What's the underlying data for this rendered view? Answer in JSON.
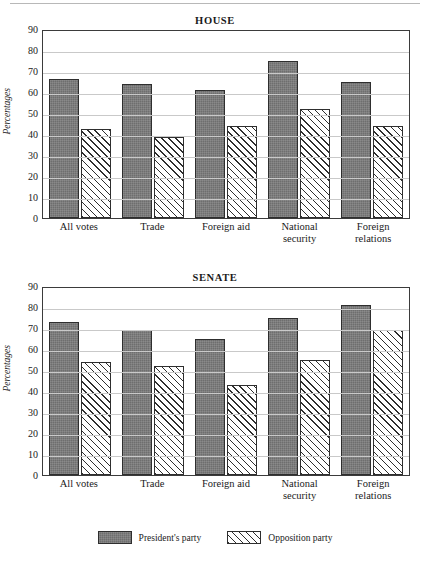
{
  "page": {
    "has_top_rule": true
  },
  "legend": {
    "position": "bottom-center",
    "entries": [
      {
        "label": "President's party",
        "pattern": "solid-dark-gray",
        "color": "#6e6e6e"
      },
      {
        "label": "Opposition party",
        "pattern": "diagonal-hatch",
        "color": "#ffffff"
      }
    ]
  },
  "chart_data": [
    {
      "type": "bar",
      "title": "HOUSE",
      "xlabel": "",
      "ylabel": "Percentages",
      "ylim": [
        0,
        90
      ],
      "yticks": [
        90,
        80,
        70,
        60,
        50,
        40,
        30,
        20,
        10,
        0
      ],
      "grid": true,
      "categories": [
        "All votes",
        "Trade",
        "Foreign aid",
        "National security",
        "Foreign relations"
      ],
      "series": [
        {
          "name": "President's party",
          "values": [
            66,
            64,
            61,
            75,
            65
          ]
        },
        {
          "name": "Opposition party",
          "values": [
            42.5,
            38.5,
            44,
            52,
            44
          ]
        }
      ]
    },
    {
      "type": "bar",
      "title": "SENATE",
      "xlabel": "",
      "ylabel": "Percentages",
      "ylim": [
        0,
        90
      ],
      "yticks": [
        90,
        80,
        70,
        60,
        50,
        40,
        30,
        20,
        10,
        0
      ],
      "grid": true,
      "categories": [
        "All votes",
        "Trade",
        "Foreign aid",
        "National security",
        "Foreign relations"
      ],
      "series": [
        {
          "name": "President's party",
          "values": [
            73,
            69,
            65,
            75,
            81
          ]
        },
        {
          "name": "Opposition party",
          "values": [
            54,
            52,
            43,
            55,
            69
          ]
        }
      ]
    }
  ]
}
